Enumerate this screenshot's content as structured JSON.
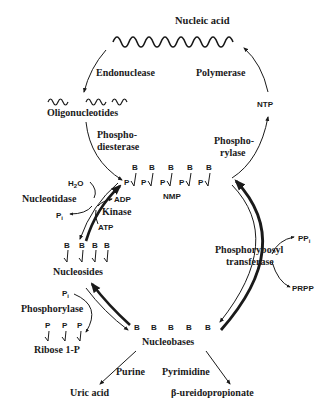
{
  "diagram": {
    "type": "metabolic-cycle",
    "nodes": {
      "nucleic_acid": "Nucleic acid",
      "oligonucleotides": "Oligonucleotides",
      "nmp": "NMP",
      "ntp": "NTP",
      "nucleosides": "Nucleosides",
      "nucleobases": "Nucleobases",
      "ribose_1p": "Ribose 1-P",
      "uric_acid": "Uric acid",
      "ureidopropionate": "β-ureidopropionate"
    },
    "enzymes": {
      "endonuclease": "Endonuclease",
      "polymerase": "Polymerase",
      "phosphodiesterase_1": "Phospho-",
      "phosphodiesterase_2": "diesterase",
      "phosphorylase_top_1": "Phospho-",
      "phosphorylase_top_2": "rylase",
      "nucleotidase": "Nucleotidase",
      "kinase": "Kinase",
      "prt_1": "Phosphorybosyl",
      "prt_2": "transferase",
      "phosphorylase": "Phosphorylase",
      "purine": "Purine",
      "pyrimidine": "Pyrimidine"
    },
    "cofactors": {
      "h2o": "H",
      "h2o_sub": "2",
      "h2o_tail": "O",
      "pi_left": "P",
      "pi_left_sub": "i",
      "adp": "ADP",
      "atp": "ATP",
      "ppi": "PP",
      "ppi_sub": "i",
      "prpp": "PRPP",
      "pi_lower": "P",
      "pi_lower_sub": "i"
    },
    "symbols": {
      "base": "B",
      "phosphate": "P"
    },
    "edges": [
      {
        "from": "Nucleic acid",
        "to": "Oligonucleotides",
        "label": "Endonuclease"
      },
      {
        "from": "Oligonucleotides",
        "to": "NMP",
        "label": "Phosphodiesterase"
      },
      {
        "from": "NMP",
        "to": "NTP",
        "label": "Phosphorylase"
      },
      {
        "from": "NTP",
        "to": "Nucleic acid",
        "label": "Polymerase"
      },
      {
        "from": "NMP",
        "to": "Nucleosides",
        "label": "Nucleotidase"
      },
      {
        "from": "Nucleosides",
        "to": "NMP",
        "label": "Kinase"
      },
      {
        "from": "Nucleobases",
        "to": "NMP",
        "label": "Phosphorybosyl transferase"
      },
      {
        "from": "NMP",
        "to": "Nucleobases",
        "label": ""
      },
      {
        "from": "Nucleosides",
        "to": "Nucleobases",
        "label": "Phosphorylase"
      },
      {
        "from": "Nucleobases",
        "to": "Nucleosides",
        "label": ""
      },
      {
        "from": "Nucleobases",
        "to": "Uric acid",
        "label": "Purine"
      },
      {
        "from": "Nucleobases",
        "to": "β-ureidopropionate",
        "label": "Pyrimidine"
      }
    ]
  }
}
